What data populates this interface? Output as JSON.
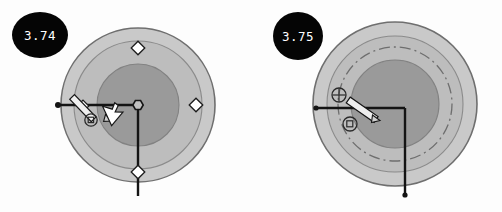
{
  "canvas": {
    "width": 502,
    "height": 212,
    "background": "#fdfdfd"
  },
  "palette": {
    "badge_fill": "#050505",
    "badge_text": "#ffffff",
    "ring_outer_fill": "#c9c9c9",
    "ring_outer_stroke": "#6f6f6f",
    "ring_mid_fill": "#bdbdbd",
    "ring_mid_stroke": "#7a7a7a",
    "ring_inner_fill": "#9a9a9a",
    "ring_inner_stroke": "#808080",
    "line_color": "#141414",
    "marker_fill": "#ffffff",
    "marker_stroke": "#1a1a1a",
    "dash_circle_stroke": "#6e6e6e",
    "cursor_fill": "#f2f2f2",
    "cursor_stroke": "#171717"
  },
  "panels": [
    {
      "id": "panel-left",
      "badge": {
        "label": "3.74",
        "cx": 40,
        "cy": 35,
        "rx": 28,
        "ry": 23
      },
      "figure": {
        "center": {
          "x": 138,
          "y": 105
        },
        "rings": [
          {
            "name": "outer-ring",
            "r": 77,
            "fill": "#c9c9c9",
            "stroke": "#6f6f6f"
          },
          {
            "name": "mid-ring",
            "r": 64,
            "fill": "#bdbdbd",
            "stroke": "#8b8b8b"
          },
          {
            "name": "inner-disc",
            "r": 41,
            "fill": "#9a9a9a",
            "stroke": "#828282"
          }
        ],
        "dash_circle": null,
        "axes": {
          "horizontal": {
            "x1": 58,
            "y1": 105,
            "x2": 138,
            "y2": 105
          },
          "vertical": {
            "x1": 138,
            "y1": 105,
            "x2": 138,
            "y2": 196
          }
        },
        "center_node": {
          "x": 138,
          "y": 105,
          "r": 5.2,
          "shape": "hexagon"
        },
        "endpoint_dot": {
          "x": 58,
          "y": 105,
          "r": 3.0
        },
        "diamond_markers": [
          {
            "name": "diamond-marker-top",
            "x": 138,
            "y": 48,
            "size": 5.2
          },
          {
            "name": "diamond-marker-right",
            "x": 196,
            "y": 105,
            "size": 5.2
          },
          {
            "name": "diamond-marker-bottom",
            "x": 138,
            "y": 172,
            "size": 5.2
          },
          {
            "name": "diamond-marker-left",
            "x": 83,
            "y": 106,
            "size": 4.4
          }
        ],
        "tools": {
          "pencil": {
            "x1": 83,
            "y1": 94,
            "x2": 110,
            "y2": 119,
            "width": 6.5
          },
          "snap_circle": {
            "x": 91,
            "y": 120,
            "r": 6.2
          },
          "arrow_cursor": {
            "x": 113,
            "y": 111
          }
        },
        "radius_label": null
      }
    },
    {
      "id": "panel-right",
      "badge": {
        "label": "3.75",
        "cx": 47,
        "cy": 36,
        "rx": 25,
        "ry": 24
      },
      "figure": {
        "center": {
          "x": 144,
          "y": 104
        },
        "rings": [
          {
            "name": "outer-ring",
            "r": 82,
            "fill": "#c9c9c9",
            "stroke": "#6f6f6f"
          },
          {
            "name": "mid-ring",
            "r": 68,
            "fill": "#bdbdbd",
            "stroke": "#8b8b8b"
          },
          {
            "name": "inner-disc",
            "r": 44,
            "fill": "#9a9a9a",
            "stroke": "#828282"
          }
        ],
        "dash_circle": {
          "name": "construction-circle",
          "r": 57,
          "stroke": "#6e6e6e",
          "dasharray": "11 4 2 4"
        },
        "axes": {
          "horizontal": {
            "x1": 65,
            "y1": 108,
            "x2": 154,
            "y2": 108
          },
          "vertical": {
            "x1": 154,
            "y1": 108,
            "x2": 154,
            "y2": 195
          }
        },
        "center_node": null,
        "endpoint_dot": {
          "x": 65,
          "y": 108,
          "r": 2.6
        },
        "diamond_markers": [],
        "tools": {
          "crosshair": {
            "x": 88,
            "y": 95,
            "r": 7.0
          },
          "pencil": {
            "x1": 96,
            "y1": 99,
            "x2": 126,
            "y2": 120,
            "width": 6.5
          },
          "snap_circle": {
            "x": 99,
            "y": 124,
            "r": 7.0
          },
          "arrow_cursor": null
        },
        "radius_label": {
          "text": "R = 4.4",
          "x": 113,
          "y": 97
        }
      }
    }
  ]
}
